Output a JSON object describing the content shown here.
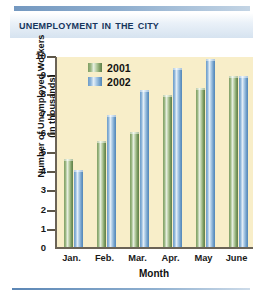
{
  "title": "Unemployment in the City",
  "legend": {
    "position": "top-left-inside",
    "items": [
      {
        "label": "2001",
        "color": "#7f9e63"
      },
      {
        "label": "2002",
        "color": "#6c9bc8"
      }
    ]
  },
  "axes": {
    "y_title_line1": "Number of Unemployed Workers",
    "y_title_line2": "(in thousands)",
    "x_title": "Month",
    "y_ticks": [
      "10",
      "9",
      "8",
      "7",
      "6",
      "5",
      "4",
      "3",
      "2",
      "1",
      "0"
    ]
  },
  "chart_data": {
    "type": "bar",
    "title": "Unemployment in the City",
    "xlabel": "Month",
    "ylabel": "Number of Unemployed Workers (in thousands)",
    "categories": [
      "Jan.",
      "Feb.",
      "Mar.",
      "Apr.",
      "May",
      "June"
    ],
    "series": [
      {
        "name": "2001",
        "color": "#7f9e63",
        "values": [
          4.6,
          5.5,
          6.0,
          7.9,
          8.3,
          8.9
        ]
      },
      {
        "name": "2002",
        "color": "#6c9bc8",
        "values": [
          4.0,
          6.9,
          8.2,
          9.3,
          9.8,
          8.9
        ]
      }
    ],
    "ylim": [
      0,
      10
    ],
    "ytick_step": 1,
    "grid": false,
    "legend": "inside-top-left"
  },
  "colors": {
    "plot_background": "#f8eec9",
    "axis": "#6b6356",
    "title_text": "#17365d",
    "title_band": "#d6e3f0",
    "rule": "#5b86b5"
  }
}
